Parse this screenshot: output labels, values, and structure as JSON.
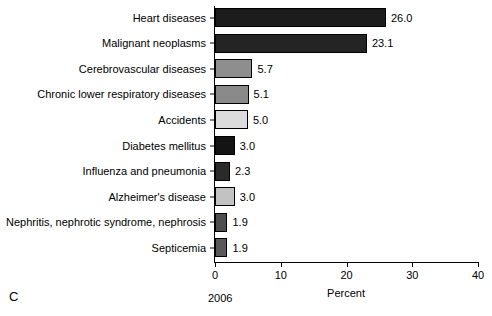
{
  "chart_data": {
    "type": "bar",
    "orientation": "horizontal",
    "title": "",
    "xlabel": "Percent",
    "ylabel": "",
    "xlim": [
      0,
      40
    ],
    "xticks": [
      0,
      10,
      20,
      30,
      40
    ],
    "xtick_labels": [
      "0",
      "10",
      "20",
      "30",
      "40"
    ],
    "grid": false,
    "legend": null,
    "categories": [
      "Heart diseases",
      "Malignant neoplasms",
      "Cerebrovascular diseases",
      "Chronic lower respiratory diseases",
      "Accidents",
      "Diabetes mellitus",
      "Influenza and pneumonia",
      "Alzheimer's disease",
      "Nephritis, nephrotic syndrome, nephrosis",
      "Septicemia"
    ],
    "values": [
      26.0,
      23.1,
      5.7,
      5.1,
      5.0,
      3.0,
      2.3,
      3.0,
      1.9,
      1.9
    ],
    "value_labels": [
      "26.0",
      "23.1",
      "5.7",
      "5.1",
      "5.0",
      "3.0",
      "2.3",
      "3.0",
      "1.9",
      "1.9"
    ],
    "bar_colors": [
      "#1c1c1c",
      "#242424",
      "#8e8e8e",
      "#8a8a8a",
      "#dcdcdc",
      "#141414",
      "#2a2a2a",
      "#c2c2c2",
      "#4e4e4e",
      "#595959"
    ],
    "bar_edge_color": "#000000"
  },
  "annotations": {
    "panel_letter": "C",
    "year_caption": "2006"
  }
}
